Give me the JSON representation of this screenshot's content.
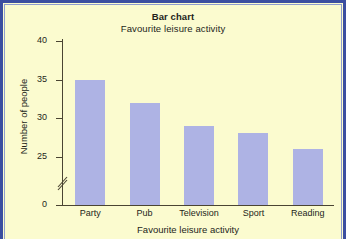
{
  "figure": {
    "background_color": "#fbfbcf",
    "frame_color": "#3b4ea0",
    "bar_color": "#aeb3e4",
    "axis_color": "#4a4432",
    "text_color": "#241f1a"
  },
  "chart_data": {
    "type": "bar",
    "title": "Bar chart",
    "subtitle": "Favourite leisure activity",
    "xlabel": "Favourite leisure activity",
    "ylabel": "Number of people",
    "categories": [
      "Party",
      "Pub",
      "Television",
      "Sport",
      "Reading"
    ],
    "values": [
      35,
      32,
      29,
      28,
      26
    ],
    "series": [
      {
        "name": "Number of people",
        "values": [
          35,
          32,
          29,
          28,
          26
        ]
      }
    ],
    "ylim": [
      0,
      40
    ],
    "y_ticks": [
      0,
      25,
      30,
      35,
      40
    ],
    "y_tick_labels": [
      "0",
      "25",
      "30",
      "35",
      "40"
    ],
    "y_axis_break": true,
    "y_axis_break_between": [
      0,
      25
    ],
    "grid": false,
    "legend": null,
    "legend_position": "none",
    "bar_color": "#aeb3e4"
  }
}
